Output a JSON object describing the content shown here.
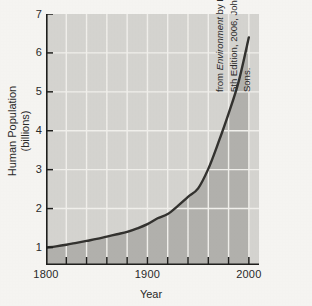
{
  "chart_data": {
    "type": "line",
    "title": "",
    "xlabel": "Year",
    "ylabel": "Human Population (billions)",
    "ylabel_line1": "Human Population",
    "ylabel_line2": "(billions)",
    "xlim": [
      1800,
      2010
    ],
    "ylim": [
      0.55,
      7
    ],
    "grid": true,
    "legend": "none",
    "y_ticks": [
      7,
      6,
      5,
      4,
      3,
      2,
      1
    ],
    "y_tick_labels": [
      "7",
      "6",
      "5",
      "4",
      "3",
      "2",
      "1"
    ],
    "x_ticks": [
      1800,
      1900,
      2000
    ],
    "x_tick_labels": [
      "1800",
      "1900",
      "2000"
    ],
    "x_minor_ticks": [
      1820,
      1840,
      1860,
      1880,
      1900,
      1920,
      1940,
      1960,
      1980,
      2000
    ],
    "x_gridlines": [
      1820,
      1840,
      1860,
      1880,
      1900,
      1920,
      1940,
      1960,
      1980,
      2000
    ],
    "y_gridlines": [
      2,
      3,
      4,
      5,
      6
    ],
    "series": [
      {
        "name": "World human population",
        "x": [
          1800,
          1810,
          1820,
          1830,
          1840,
          1850,
          1860,
          1870,
          1880,
          1890,
          1900,
          1910,
          1920,
          1930,
          1940,
          1950,
          1960,
          1970,
          1980,
          1990,
          2000
        ],
        "values": [
          1.0,
          1.03,
          1.07,
          1.12,
          1.17,
          1.22,
          1.28,
          1.34,
          1.4,
          1.49,
          1.6,
          1.75,
          1.86,
          2.07,
          2.3,
          2.52,
          3.02,
          3.7,
          4.44,
          5.27,
          6.4
        ]
      }
    ],
    "fill_under_curve": true,
    "annotations": [],
    "colors": {
      "plot_background_upper": "#d6d5d1",
      "plot_background_lower": "#b3b2ae",
      "gridline": "#f2f1ed",
      "curve": "#33322f",
      "axis": "#1f1f1d",
      "page_background": "#f7f6f3"
    }
  },
  "attribution": {
    "line1_prefix": "from ",
    "line1_italic": "Environment",
    "line1_suffix": " by Raven and Berg,",
    "line2": "5th Edition, 2006, John Wiley and",
    "line3": "Sons."
  }
}
